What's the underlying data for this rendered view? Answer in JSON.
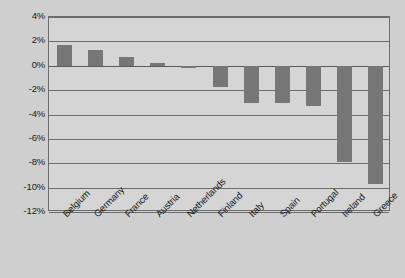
{
  "chart_data": {
    "type": "bar",
    "title": "",
    "subtitle": "",
    "xlabel": "",
    "ylabel": "",
    "categories": [
      "Belgium",
      "Germany",
      "France",
      "Austria",
      "Netherlands",
      "Finland",
      "Italy",
      "Spain",
      "Portugal",
      "Ireland",
      "Greece"
    ],
    "values": [
      1.7,
      1.3,
      0.7,
      0.25,
      -0.2,
      -1.75,
      -3.0,
      -3.05,
      -3.3,
      -7.9,
      -9.7
    ],
    "value_suffix": "%",
    "ylim": [
      -12,
      4
    ],
    "ytick_values": [
      4,
      2,
      0,
      -2,
      -4,
      -6,
      -8,
      -10,
      -12
    ],
    "ytick_labels": [
      "4%",
      "2%",
      "0%",
      "-2%",
      "-4%",
      "-6%",
      "-8%",
      "-10%",
      "-12%"
    ],
    "grid": true,
    "grid_axis": "y",
    "legend": false,
    "legend_position": "none",
    "bar_color": "#777777",
    "plot_background": "#d5d5d5",
    "page_background": "#cfcfcf",
    "axis_color": "#6d6d6d",
    "text_color": "#1a1a1a",
    "xtick_rotation": -45
  }
}
